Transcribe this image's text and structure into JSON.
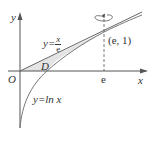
{
  "diagram": {
    "axes": {
      "x_label": "x",
      "y_label": "y",
      "origin_label": "O"
    },
    "tick_e_label": "e",
    "point_label": "(e, 1)",
    "region_label": "D",
    "line_label": {
      "prefix": "y=",
      "numerator": "x",
      "denominator": "e"
    },
    "curve_label": "y=ln x",
    "rotation_indicator": "rotation about x = e",
    "colors": {
      "stroke": "#555555",
      "region_fill": "#e4e4e4"
    }
  }
}
